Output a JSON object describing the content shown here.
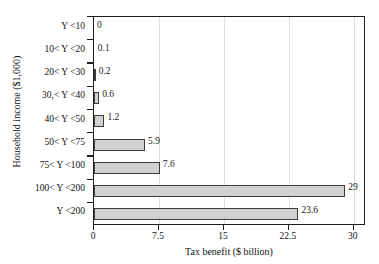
{
  "chart_data": {
    "type": "bar",
    "orientation": "horizontal",
    "title": "",
    "xlabel": "Tax benefit ($ billion)",
    "ylabel": "Household income ($1,000)",
    "categories": [
      "Y <10",
      "10< Y <20",
      "20< Y <30",
      "30,< Y <40",
      "40< Y <50",
      "50< Y <75",
      "75< Y <100",
      "100< Y <200",
      "Y <200"
    ],
    "values": [
      0,
      0.1,
      0.2,
      0.6,
      1.2,
      5.9,
      7.6,
      29,
      23.6
    ],
    "value_labels": [
      "0",
      "0.1",
      "0.2",
      "0.6",
      "1.2",
      "5.9",
      "7.6",
      "29",
      "23.6"
    ],
    "xlim": [
      0,
      31.4
    ],
    "xticks": [
      0,
      7.5,
      15,
      22.5,
      30
    ],
    "xtick_labels": [
      "0",
      "7.5",
      "15",
      "22.5",
      "30"
    ],
    "grid": "vertical",
    "legend": "none",
    "bar_color": "#d2d2d2",
    "bar_edge_color": "#3d3d3d",
    "axis_color": "#1d1d1d",
    "grid_color": "#dedede"
  },
  "clipped_title_fragment": "·····  ···"
}
